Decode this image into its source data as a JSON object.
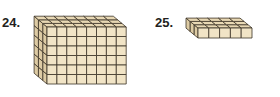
{
  "problems": [
    {
      "number": "24.",
      "figure": "rectangular prism made of unit cubes",
      "front_columns": 8,
      "front_rows": 6,
      "depth": 3
    },
    {
      "number": "25.",
      "figure": "rectangular prism made of unit cubes",
      "front_columns": 5,
      "front_rows": 1,
      "depth": 3
    }
  ],
  "colors": {
    "cube_face": "#f1e4c6",
    "cube_top": "#e8d8b4",
    "cube_side": "#ddcba4",
    "grid_line": "#3b3226"
  }
}
